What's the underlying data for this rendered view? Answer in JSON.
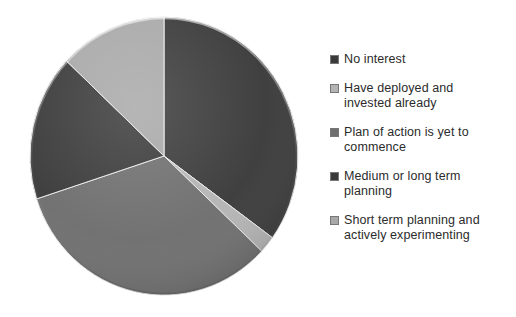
{
  "chart_data": {
    "type": "pie",
    "title": "",
    "subtitle": "",
    "legend_position": "right",
    "grid": false,
    "start_angle_deg": 0,
    "direction": "clockwise",
    "categories": [
      "No interest",
      "Have deployed and invested already",
      "Plan of action is yet to commence",
      "Medium or long term planning",
      "Short term planning and actively experimenting"
    ],
    "values": [
      35,
      2,
      33,
      17,
      13
    ],
    "colors": [
      "#3a3a3a",
      "#b4b4b4",
      "#6e6e6e",
      "#3a3a3a",
      "#a8a8a8"
    ],
    "labels_visible": false,
    "xlabel": "",
    "ylabel": ""
  },
  "legend": {
    "items": [
      {
        "label": "No interest",
        "color": "#3a3a3a"
      },
      {
        "label": "Have deployed and invested already",
        "color": "#b4b4b4"
      },
      {
        "label": "Plan of action is yet to commence",
        "color": "#6e6e6e"
      },
      {
        "label": "Medium or long term planning",
        "color": "#3a3a3a"
      },
      {
        "label": "Short term planning and actively experimenting",
        "color": "#a8a8a8"
      }
    ]
  }
}
